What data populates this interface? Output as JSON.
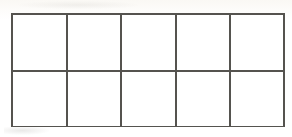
{
  "figure": {
    "kind": "grid-diagram"
  },
  "grid": {
    "rows": 2,
    "columns": 5,
    "total_cells": 10,
    "filled_cells": 0,
    "empty_cells": 10,
    "cell_contents": [
      [
        "",
        "",
        "",
        "",
        ""
      ],
      [
        "",
        "",
        "",
        "",
        ""
      ]
    ],
    "cell_names": [
      [
        "cell-r1c1",
        "cell-r1c2",
        "cell-r1c3",
        "cell-r1c4",
        "cell-r1c5"
      ],
      [
        "cell-r2c1",
        "cell-r2c2",
        "cell-r2c3",
        "cell-r2c4",
        "cell-r2c5"
      ]
    ]
  },
  "geometry": {
    "canvas_width": 292,
    "canvas_height": 137,
    "frame_left": 11,
    "frame_top": 13,
    "frame_width": 274,
    "frame_height": 114,
    "line_width": 2,
    "column_x_positions": [
      11,
      66,
      120,
      175,
      229,
      283
    ],
    "row_y_positions": [
      13,
      70,
      126
    ]
  },
  "colors": {
    "line": "#55534f",
    "cell_fill": "#ffffff",
    "page_background": "#fefdfb",
    "paper_tint": "#faf8f4"
  }
}
